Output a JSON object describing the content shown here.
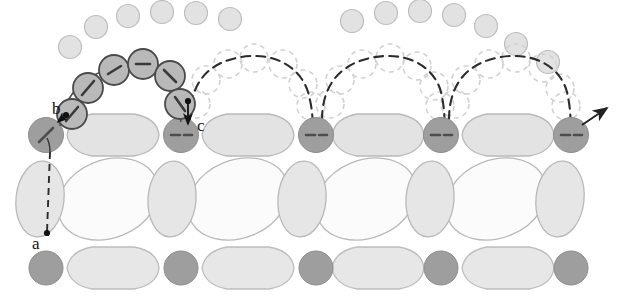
{
  "figure": {
    "width": 621,
    "height": 303,
    "background_color": "#ffffff"
  },
  "labels": [
    {
      "id": "a",
      "text": "a",
      "x": 36,
      "y": 243,
      "marker_x": 46,
      "marker_y": 234
    },
    {
      "id": "b",
      "text": "b",
      "x": 57,
      "y": 108,
      "marker_x": 70,
      "marker_y": 112
    },
    {
      "id": "c",
      "text": "c",
      "x": 199,
      "y": 127,
      "marker_x": 188,
      "marker_y": 112
    }
  ],
  "colors": {
    "dark_particle_fill": "#9e9e9e",
    "dark_particle_stroke": "#8a8a8a",
    "traj_particle_fill": "#b4b4b4",
    "traj_particle_stroke": "#4a4a4a",
    "top_circle_fill": "#e2e2e2",
    "top_circle_stroke": "#bdbdbd",
    "ghost_stroke": "#cfcfcf",
    "blob_gray_fill": "#e3e3e3",
    "blob_light_fill": "#fbfbfb",
    "blob_stroke": "#b9b9b9",
    "path_solid": "#3a3a3a",
    "path_dashed": "#2b2b2b",
    "label_color": "#111111"
  },
  "lattice": {
    "row_top_adatoms": {
      "name": "upper scattered adatom arc",
      "radius": 11,
      "positions": [
        [
          70,
          47
        ],
        [
          96,
          27
        ],
        [
          128,
          16
        ],
        [
          162,
          12
        ],
        [
          196,
          13
        ],
        [
          230,
          19
        ],
        [
          352,
          21
        ],
        [
          386,
          13
        ],
        [
          420,
          11
        ],
        [
          454,
          15
        ],
        [
          486,
          26
        ],
        [
          516,
          44
        ],
        [
          548,
          62
        ]
      ]
    },
    "row1_y": 135,
    "row1_dark_circles": {
      "radius": 17,
      "cx": [
        46,
        181,
        316,
        441,
        571
      ]
    },
    "row1_blobs": {
      "shape": "wide-hexagon",
      "rx": 46,
      "ry": 23,
      "cx": [
        113,
        248,
        378,
        508
      ]
    },
    "row2_y": 199,
    "row2_narrow_blobs": {
      "shape": "tall-oval",
      "rx": 23,
      "ry": 37,
      "cx": [
        40,
        172,
        302,
        430,
        560
      ]
    },
    "row2_wide_blobs": {
      "shape": "tilted-ellipse",
      "rx": 52,
      "ry": 39,
      "cx": [
        108,
        238,
        366,
        496
      ]
    },
    "row3_y": 268,
    "row3_dark_circles": {
      "radius": 17,
      "cx": [
        46,
        181,
        316,
        441,
        571
      ]
    },
    "row3_blobs": {
      "shape": "wide-hexagon",
      "rx": 46,
      "ry": 23,
      "cx": [
        113,
        248,
        378,
        508
      ]
    }
  },
  "trajectories": {
    "solid_hop": {
      "name": "first hop (resolved, solid)",
      "style": "solid",
      "description": "molecule leaves site b, arcs over a lattice blob and lands at site c",
      "particles": {
        "radius": 15,
        "stops": [
          {
            "x": 72,
            "y": 114,
            "dash_angle": 55
          },
          {
            "x": 88,
            "y": 88,
            "dash_angle": 40
          },
          {
            "x": 114,
            "y": 70,
            "dash_angle": 12
          },
          {
            "x": 143,
            "y": 64,
            "dash_angle": -2
          },
          {
            "x": 170,
            "y": 76,
            "dash_angle": -30
          },
          {
            "x": 180,
            "y": 104,
            "dash_angle": -55
          }
        ]
      }
    },
    "dashed_hops": {
      "name": "subsequent hops (dashed ghost positions)",
      "style": "dashed",
      "ghost_radius": 14,
      "hops": [
        {
          "from_x": 181,
          "to_x": 316,
          "ghosts": [
            [
              196,
              104
            ],
            [
              206,
              80
            ],
            [
              228,
              64
            ],
            [
              254,
              58
            ],
            [
              283,
              64
            ],
            [
              303,
              84
            ],
            [
              311,
              106
            ]
          ]
        },
        {
          "from_x": 316,
          "to_x": 441,
          "ghosts": [
            [
              330,
              104
            ],
            [
              340,
              80
            ],
            [
              362,
              64
            ],
            [
              390,
              58
            ],
            [
              417,
              66
            ],
            [
              434,
              86
            ],
            [
              440,
              106
            ]
          ]
        },
        {
          "from_x": 441,
          "to_x": 571,
          "ghosts": [
            [
              455,
              104
            ],
            [
              466,
              80
            ],
            [
              489,
              64
            ],
            [
              516,
              58
            ],
            [
              543,
              68
            ],
            [
              560,
              88
            ],
            [
              566,
              106
            ]
          ]
        }
      ]
    },
    "exit_arrow": {
      "name": "exit arrow from final site",
      "from": [
        583,
        124
      ],
      "to": [
        609,
        107
      ]
    },
    "entry_line": {
      "name": "dashed vertical line from a up to site b",
      "from": [
        46,
        234
      ],
      "to": [
        50,
        170
      ]
    }
  }
}
